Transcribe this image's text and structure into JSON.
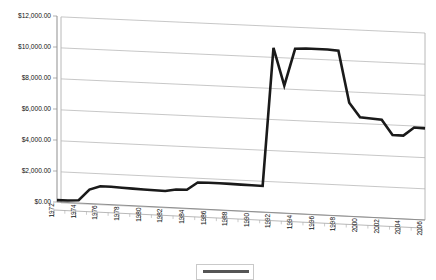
{
  "chart_data": {
    "type": "line",
    "title": "",
    "xlabel": "",
    "ylabel": "",
    "ylim": [
      0,
      12000
    ],
    "ytick_labels": [
      "$0.00",
      "$2,000.00",
      "$4,000.00",
      "$6,000.00",
      "$8,000.00",
      "$10,000.00",
      "$12,000.00"
    ],
    "ytick_values": [
      0,
      2000,
      4000,
      6000,
      8000,
      10000,
      12000
    ],
    "grid": true,
    "legend_position": "bottom",
    "legend_entries": [
      ""
    ],
    "xtick_labels": [
      "1972",
      "1974",
      "1976",
      "1978",
      "1980",
      "1982",
      "1984",
      "1986",
      "1988",
      "1990",
      "1992",
      "1994",
      "1996",
      "1998",
      "2000",
      "2002",
      "2004",
      "2006"
    ],
    "x": [
      1972,
      1973,
      1974,
      1975,
      1976,
      1977,
      1978,
      1979,
      1980,
      1981,
      1982,
      1983,
      1984,
      1985,
      1986,
      1987,
      1988,
      1989,
      1990,
      1991,
      1992,
      1993,
      1994,
      1995,
      1996,
      1997,
      1998,
      1999,
      2000,
      2001,
      2002,
      2003,
      2004,
      2005,
      2006
    ],
    "values": [
      120,
      130,
      180,
      900,
      1150,
      1150,
      1120,
      1100,
      1080,
      1060,
      1050,
      1180,
      1200,
      1700,
      1720,
      1720,
      1710,
      1700,
      1690,
      1680,
      10600,
      8200,
      10600,
      10650,
      10650,
      10650,
      10600,
      7300,
      6400,
      6350,
      6300,
      5350,
      5350,
      5900,
      5880
    ],
    "series": [
      {
        "name": "",
        "values": [
          120,
          130,
          180,
          900,
          1150,
          1150,
          1120,
          1100,
          1080,
          1060,
          1050,
          1180,
          1200,
          1700,
          1720,
          1720,
          1710,
          1700,
          1690,
          1680,
          10600,
          8200,
          10600,
          10650,
          10650,
          10650,
          10600,
          7300,
          6400,
          6350,
          6300,
          5350,
          5350,
          5900,
          5880
        ]
      }
    ],
    "line_color": "#1a1a1a",
    "grid_color": "#b9b9b9",
    "background_color": "#ffffff"
  }
}
